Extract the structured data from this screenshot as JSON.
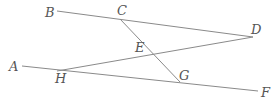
{
  "diagram": {
    "type": "geometry",
    "line_color": "#8a8a8a",
    "label_color": "#555555",
    "points": {
      "A": {
        "label": "A",
        "x": 22,
        "y": 66
      },
      "B": {
        "label": "B",
        "x": 57,
        "y": 11
      },
      "C": {
        "label": "C",
        "x": 120,
        "y": 19
      },
      "D": {
        "label": "D",
        "x": 253,
        "y": 37
      },
      "E": {
        "label": "E",
        "x": 153,
        "y": 53
      },
      "F": {
        "label": "F",
        "x": 258,
        "y": 91
      },
      "G": {
        "label": "G",
        "x": 180,
        "y": 82
      },
      "H": {
        "label": "H",
        "x": 57,
        "y": 71
      }
    },
    "segments": [
      {
        "from": "B",
        "to": "D"
      },
      {
        "from": "A",
        "to": "F"
      },
      {
        "from": "H",
        "to": "D"
      },
      {
        "from": "C",
        "to": "G"
      }
    ]
  }
}
